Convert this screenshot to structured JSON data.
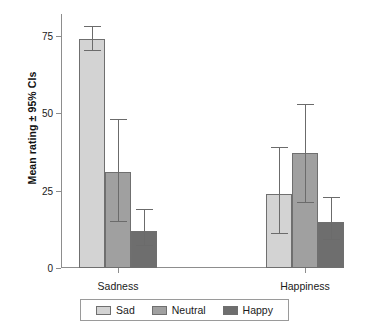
{
  "chart_data": {
    "type": "bar",
    "title": "",
    "subtitle": "",
    "xlabel": "",
    "ylabel": "Mean rating ± 95% CIs",
    "ylim": [
      0,
      82
    ],
    "yticks": [
      0,
      25,
      50,
      75
    ],
    "ytick_labels": [
      "0",
      "25",
      "50",
      "75"
    ],
    "grid": false,
    "legend_position": "bottom",
    "error_bars": "95% CI",
    "categories": [
      "Sadness",
      "Happiness"
    ],
    "series": [
      {
        "name": "Sad",
        "color": "#d3d3d3",
        "values": [
          74,
          24
        ],
        "ci_low": [
          70,
          11
        ],
        "ci_high": [
          78,
          39
        ]
      },
      {
        "name": "Neutral",
        "color": "#a0a0a0",
        "values": [
          31,
          37
        ],
        "ci_low": [
          15,
          21
        ],
        "ci_high": [
          48,
          53
        ]
      },
      {
        "name": "Happy",
        "color": "#6e6e6e",
        "values": [
          12,
          15
        ],
        "ci_low": [
          7,
          9
        ],
        "ci_high": [
          19,
          23
        ]
      }
    ]
  },
  "axes": {
    "y_title": "Mean rating ± 95% CIs",
    "y_tick_0": "0",
    "y_tick_25": "25",
    "y_tick_50": "50",
    "y_tick_75": "75",
    "x_group_1": "Sadness",
    "x_group_2": "Happiness"
  },
  "legend": {
    "items": [
      {
        "label": "Sad",
        "color": "#d3d3d3"
      },
      {
        "label": "Neutral",
        "color": "#a0a0a0"
      },
      {
        "label": "Happy",
        "color": "#6e6e6e"
      }
    ]
  },
  "colors": {
    "sad": "#d3d3d3",
    "neutral": "#a0a0a0",
    "happy": "#6e6e6e",
    "axis": "#8d8d8d",
    "bar_outline": "#6f6f6f",
    "error_bar": "#6b6b6b",
    "background": "#ffffff"
  }
}
